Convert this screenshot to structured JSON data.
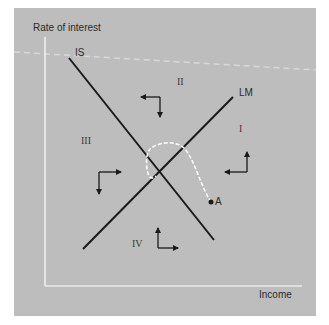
{
  "diagram": {
    "y_axis_label": "Rate of interest",
    "x_axis_label": "Income",
    "curves": {
      "is_label": "IS",
      "lm_label": "LM"
    },
    "regions": {
      "r1": "I",
      "r2": "II",
      "r3": "III",
      "r4": "IV"
    },
    "point_label": "A",
    "colors": {
      "background": "#bdbdbd",
      "lines": "#1a1a1a",
      "axes": "#ffffff",
      "path": "#ffffff"
    }
  }
}
